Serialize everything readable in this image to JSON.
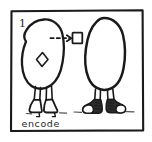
{
  "panel": {
    "index_label": "1",
    "caption": "encode",
    "frame_color": "#1a1a1a",
    "ink_color": "#1a1a1a",
    "background_color": "#ffffff",
    "shoe_dark_color": "#2b2b2b",
    "figures": [
      {
        "name": "left-figure",
        "body_shape": "pear-blob",
        "footwear": "high-heels",
        "marks": [
          {
            "name": "diamond-symbol",
            "shape": "diamond"
          },
          {
            "name": "dashed-arrow",
            "shape": "dashed-arrow-right"
          },
          {
            "name": "square-symbol",
            "shape": "square-outline"
          }
        ]
      },
      {
        "name": "right-figure",
        "body_shape": "egg-blob",
        "footwear": "sneakers",
        "marks": []
      }
    ]
  }
}
